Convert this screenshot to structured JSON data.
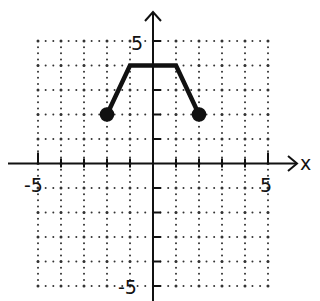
{
  "chart_data": {
    "type": "line",
    "title": "",
    "xlabel": "x",
    "ylabel": "",
    "xlim": [
      -5,
      5
    ],
    "ylim": [
      -5,
      5
    ],
    "grid": true,
    "grid_style": "dotted",
    "tick_labels": {
      "x": [
        {
          "value": -5,
          "label": "-5"
        },
        {
          "value": 5,
          "label": "5"
        }
      ],
      "y": [
        {
          "value": 5,
          "label": "5"
        },
        {
          "value": -5,
          "label": "-5"
        }
      ]
    },
    "series": [
      {
        "name": "f(x)",
        "points": [
          [
            -2,
            2
          ],
          [
            -1,
            4
          ],
          [
            1,
            4
          ],
          [
            2,
            2
          ]
        ],
        "endpoints": [
          {
            "x": -2,
            "y": 2,
            "style": "closed"
          },
          {
            "x": 2,
            "y": 2,
            "style": "closed"
          }
        ],
        "color": "#111111"
      }
    ],
    "legend": null
  },
  "colors": {
    "ink": "#111111",
    "grid": "#333333",
    "background": "#ffffff"
  },
  "labels": {
    "x_axis": "x",
    "x_min": "-5",
    "x_max": "5",
    "y_max": "5",
    "y_min": "-5"
  }
}
